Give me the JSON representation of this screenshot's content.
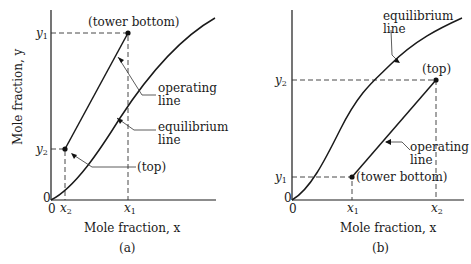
{
  "panels": {
    "a": {
      "caption": "(a)",
      "xlabel": "Mole fraction, x",
      "ylabel": "Mole fraction, y",
      "origin_x": "0",
      "origin_y": "0",
      "ticks_x": [
        {
          "main": "x",
          "sub": "2"
        },
        {
          "main": "x",
          "sub": "1"
        }
      ],
      "ticks_y": [
        {
          "main": "y",
          "sub": "1"
        },
        {
          "main": "y",
          "sub": "2"
        }
      ],
      "annotations": {
        "tower_bottom": "(tower bottom)",
        "operating_line_1": "operating",
        "operating_line_2": "line",
        "equilibrium_line_1": "equilibrium",
        "equilibrium_line_2": "line",
        "top": "(top)"
      }
    },
    "b": {
      "caption": "(b)",
      "xlabel": "Mole fraction, x",
      "origin_x": "0",
      "origin_y": "0",
      "ticks_x": [
        {
          "main": "x",
          "sub": "1"
        },
        {
          "main": "x",
          "sub": "2"
        }
      ],
      "ticks_y": [
        {
          "main": "y",
          "sub": "2"
        },
        {
          "main": "y",
          "sub": "1"
        }
      ],
      "annotations": {
        "equilibrium_line_1": "equilibrium",
        "equilibrium_line_2": "line",
        "top": "(top)",
        "operating_line_1": "operating",
        "operating_line_2": "line",
        "tower_bottom": "(tower bottom)"
      }
    }
  },
  "colors": {
    "ink": "#1a1a1a",
    "background": "#ffffff"
  }
}
